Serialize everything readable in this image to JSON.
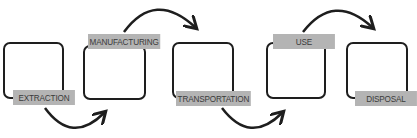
{
  "stages": [
    {
      "label": "EXTRACTION"
    },
    {
      "label": "MANUFACTURING"
    },
    {
      "label": "TRANSPORTATION"
    },
    {
      "label": "USE"
    },
    {
      "label": "DISPOSAL"
    }
  ],
  "arrows": [
    {
      "from": "EXTRACTION",
      "to": "MANUFACTURING",
      "side": "bottom"
    },
    {
      "from": "MANUFACTURING",
      "to": "TRANSPORTATION",
      "side": "top"
    },
    {
      "from": "TRANSPORTATION",
      "to": "USE",
      "side": "bottom"
    },
    {
      "from": "USE",
      "to": "DISPOSAL",
      "side": "top"
    }
  ],
  "colors": {
    "line": "#1e1e1e",
    "label_bg": "#b4b4b4",
    "label_text": "#3a3a3a"
  }
}
